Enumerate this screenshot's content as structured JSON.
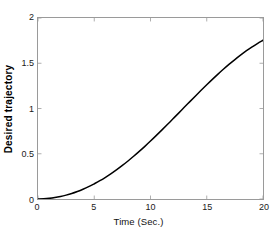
{
  "chart_data": {
    "type": "line",
    "title": "",
    "xlabel": "Time (Sec.)",
    "ylabel": "Desired trajectory",
    "xlim": [
      0,
      20
    ],
    "ylim": [
      0,
      2
    ],
    "xticks": [
      0,
      5,
      10,
      15,
      20
    ],
    "xticklabels": [
      "0",
      "5",
      "10",
      "15",
      "20"
    ],
    "yticks": [
      0,
      0.5,
      1,
      1.5,
      2
    ],
    "yticklabels": [
      "0",
      "0.5",
      "1",
      "1.5",
      "2"
    ],
    "grid": false,
    "box": true,
    "legend": null,
    "line_color": "#000000",
    "line_width": 1.4,
    "series": [
      {
        "name": "Desired trajectory",
        "x": [
          0,
          0.5,
          1,
          1.5,
          2,
          2.5,
          3,
          3.5,
          4,
          4.5,
          5,
          5.5,
          6,
          6.5,
          7,
          7.5,
          8,
          8.5,
          9,
          9.5,
          10,
          10.5,
          11,
          11.5,
          12,
          12.5,
          13,
          13.5,
          14,
          14.5,
          15,
          15.5,
          16,
          16.5,
          17,
          17.5,
          18,
          18.5,
          19,
          19.5,
          20
        ],
        "y": [
          0.0,
          0.002,
          0.007,
          0.016,
          0.028,
          0.043,
          0.061,
          0.083,
          0.108,
          0.136,
          0.168,
          0.202,
          0.24,
          0.281,
          0.325,
          0.371,
          0.42,
          0.472,
          0.526,
          0.582,
          0.64,
          0.7,
          0.761,
          0.823,
          0.886,
          0.949,
          1.013,
          1.076,
          1.139,
          1.201,
          1.262,
          1.322,
          1.38,
          1.436,
          1.49,
          1.541,
          1.59,
          1.636,
          1.679,
          1.718,
          1.754
        ]
      }
    ],
    "note_shape": "smooth monotonic S-curve rising from 0 at t=0 to 2 at t=20"
  },
  "axes": {
    "x_tick_labels": [
      "0",
      "5",
      "10",
      "15",
      "20"
    ],
    "y_tick_labels": [
      "0",
      "0.5",
      "1",
      "1.5",
      "2"
    ],
    "x_title": "Time (Sec.)",
    "y_title": "Desired trajectory"
  },
  "colors": {
    "curve": "#000000",
    "axis": "#9a9a9a",
    "tick_text": "#1a1a1a",
    "background": "#ffffff"
  }
}
